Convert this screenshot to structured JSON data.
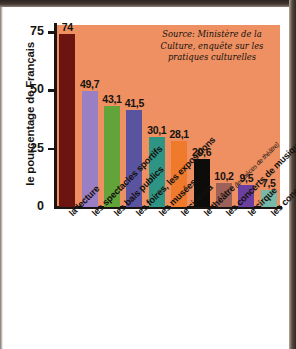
{
  "chart_data": {
    "type": "bar",
    "title": "",
    "subtitle": "",
    "xlabel": "",
    "ylabel": "le pourcentage de Français",
    "ylim": [
      0,
      78
    ],
    "yticks": [
      "0",
      "25",
      "50",
      "75"
    ],
    "ytick_values": [
      0,
      25,
      50,
      75
    ],
    "grid": false,
    "legend": "none",
    "source_note": "Source: Ministère de la Culture, enquête sur les pratiques culturelles",
    "categories": [
      "la lecture",
      "les spectacles sportifs",
      "les bals publics",
      "les foires, les expositions",
      "les musées",
      "le cinéma",
      "le théâtre",
      "les concerts de musique populaire",
      "le cirque",
      "les concerts de musique classique"
    ],
    "category_annotations": [
      "",
      "",
      "",
      "",
      "",
      "",
      "(les pièces de théâtre)",
      "",
      "",
      ""
    ],
    "values": [
      74,
      49.7,
      43.1,
      41.5,
      30.1,
      28.1,
      20.6,
      10.2,
      9.5,
      7.5
    ],
    "value_labels": [
      "74",
      "49,7",
      "43,1",
      "41,5",
      "30,1",
      "28,1",
      "20,6",
      "10,2",
      "9,5",
      "7,5"
    ],
    "bar_colors": [
      "#6b1410",
      "#9b7fc4",
      "#63a43a",
      "#5a53a0",
      "#2e9484",
      "#f07a2c",
      "#0d0c0a",
      "#9d6159",
      "#6b3fa0",
      "#78b8a8"
    ],
    "plot_background": "#ee9062",
    "axis_color": "#1a1512",
    "text_color": "#171310"
  }
}
